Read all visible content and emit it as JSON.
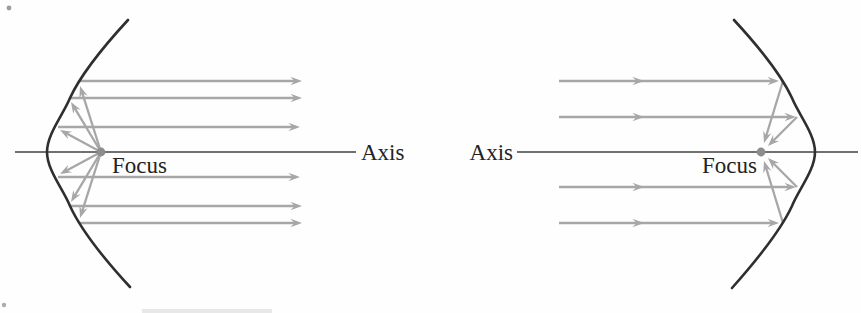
{
  "figure": {
    "description_labels_only": "",
    "colors": {
      "ray": "#a7a7a7",
      "curve": "#2f2f2f",
      "axis": "#404040",
      "dot": "#8d8d8d",
      "text": "#232323",
      "background": "#fefefe",
      "artifact": "#4a4a4a"
    }
  },
  "diagrams": [
    {
      "id": "emitting-parabolic-mirror",
      "axis_label": "Axis",
      "focus_label": "Focus",
      "elements": [
        {
          "name": "axis-line",
          "type": "line",
          "x1": 15,
          "y1": 152,
          "x2": 356,
          "y2": 152,
          "stroke": "axis",
          "width": 1.4
        },
        {
          "name": "reflected-parallel-ray",
          "type": "arrow",
          "x1": 79,
          "y1": 81,
          "x2": 302,
          "y2": 81,
          "stroke": "ray",
          "width": 2.3
        },
        {
          "name": "reflected-parallel-ray",
          "type": "arrow",
          "x1": 70,
          "y1": 98,
          "x2": 302,
          "y2": 98,
          "stroke": "ray",
          "width": 2.3
        },
        {
          "name": "reflected-parallel-ray",
          "type": "arrow",
          "x1": 58,
          "y1": 127,
          "x2": 300,
          "y2": 127,
          "stroke": "ray",
          "width": 2.3
        },
        {
          "name": "reflected-parallel-ray",
          "type": "arrow",
          "x1": 58,
          "y1": 177,
          "x2": 300,
          "y2": 177,
          "stroke": "ray",
          "width": 2.3
        },
        {
          "name": "reflected-parallel-ray",
          "type": "arrow",
          "x1": 70,
          "y1": 206,
          "x2": 302,
          "y2": 206,
          "stroke": "ray",
          "width": 2.3
        },
        {
          "name": "reflected-parallel-ray",
          "type": "arrow",
          "x1": 79,
          "y1": 223,
          "x2": 302,
          "y2": 223,
          "stroke": "ray",
          "width": 2.3
        },
        {
          "name": "focus-emitted-ray",
          "type": "arrow",
          "x1": 101,
          "y1": 152,
          "x2": 80,
          "y2": 86,
          "stroke": "ray",
          "width": 2.3
        },
        {
          "name": "focus-emitted-ray",
          "type": "arrow",
          "x1": 101,
          "y1": 152,
          "x2": 71,
          "y2": 102,
          "stroke": "ray",
          "width": 2.3
        },
        {
          "name": "focus-emitted-ray",
          "type": "arrow",
          "x1": 101,
          "y1": 152,
          "x2": 60,
          "y2": 130,
          "stroke": "ray",
          "width": 2.3
        },
        {
          "name": "focus-emitted-ray",
          "type": "arrow",
          "x1": 101,
          "y1": 152,
          "x2": 60,
          "y2": 174,
          "stroke": "ray",
          "width": 2.3
        },
        {
          "name": "focus-emitted-ray",
          "type": "arrow",
          "x1": 101,
          "y1": 152,
          "x2": 71,
          "y2": 202,
          "stroke": "ray",
          "width": 2.3
        },
        {
          "name": "focus-emitted-ray",
          "type": "arrow",
          "x1": 101,
          "y1": 152,
          "x2": 80,
          "y2": 218,
          "stroke": "ray",
          "width": 2.3
        },
        {
          "name": "parabola-curve",
          "type": "path",
          "d": "M 128,20 C 104,46 82,72 70,98 C 63,115 47,134 47,152 C 47,170 63,189 70,206 C 82,232 106,261 130,287",
          "stroke": "curve",
          "width": 2.6
        },
        {
          "name": "focus-point",
          "type": "dot",
          "x": 101,
          "y": 152,
          "r": 4.4,
          "fill": "dot"
        }
      ]
    },
    {
      "id": "collecting-parabolic-mirror",
      "axis_label": "Axis",
      "focus_label": "Focus",
      "elements": [
        {
          "name": "axis-line",
          "type": "line",
          "x1": 517,
          "y1": 152,
          "x2": 858,
          "y2": 152,
          "stroke": "axis",
          "width": 1.4
        },
        {
          "name": "incoming-parallel-ray",
          "type": "arrow",
          "x1": 559,
          "y1": 81,
          "x2": 779,
          "y2": 81,
          "stroke": "ray",
          "width": 2.3,
          "mid_x": 644
        },
        {
          "name": "incoming-parallel-ray",
          "type": "arrow",
          "x1": 559,
          "y1": 117,
          "x2": 796,
          "y2": 117,
          "stroke": "ray",
          "width": 2.3,
          "mid_x": 644
        },
        {
          "name": "incoming-parallel-ray",
          "type": "arrow",
          "x1": 559,
          "y1": 187,
          "x2": 796,
          "y2": 187,
          "stroke": "ray",
          "width": 2.3,
          "mid_x": 644
        },
        {
          "name": "incoming-parallel-ray",
          "type": "arrow",
          "x1": 559,
          "y1": 223,
          "x2": 779,
          "y2": 223,
          "stroke": "ray",
          "width": 2.3,
          "mid_x": 644
        },
        {
          "name": "converging-ray-to-focus",
          "type": "arrow",
          "x1": 783,
          "y1": 81,
          "x2": 764,
          "y2": 143,
          "stroke": "ray",
          "width": 2.3
        },
        {
          "name": "converging-ray-to-focus",
          "type": "arrow",
          "x1": 797,
          "y1": 117,
          "x2": 768,
          "y2": 146,
          "stroke": "ray",
          "width": 2.3
        },
        {
          "name": "converging-ray-to-focus",
          "type": "arrow",
          "x1": 797,
          "y1": 187,
          "x2": 768,
          "y2": 158,
          "stroke": "ray",
          "width": 2.3
        },
        {
          "name": "converging-ray-to-focus",
          "type": "arrow",
          "x1": 783,
          "y1": 223,
          "x2": 764,
          "y2": 161,
          "stroke": "ray",
          "width": 2.3
        },
        {
          "name": "parabola-curve",
          "type": "path",
          "d": "M 734,20 C 758,46 780,72 792,98 C 799,115 815,134 815,152 C 815,170 799,189 792,206 C 780,232 756,261 732,288",
          "stroke": "curve",
          "width": 2.6
        },
        {
          "name": "focus-point",
          "type": "dot",
          "x": 761,
          "y": 152,
          "r": 4.4,
          "fill": "dot"
        }
      ]
    }
  ],
  "artifacts": [
    {
      "name": "scan-speck",
      "type": "dot",
      "x": 9,
      "y": 8,
      "r": 2.4,
      "fill": "artifact",
      "opacity": 0.55
    },
    {
      "name": "scan-speck",
      "type": "dot",
      "x": 4,
      "y": 305,
      "r": 2.2,
      "fill": "artifact",
      "opacity": 0.45
    },
    {
      "name": "cropped-caption-smudge",
      "type": "rect",
      "x": 142,
      "y": 309,
      "w": 130,
      "h": 4,
      "fill": "artifact",
      "opacity": 0.12
    }
  ]
}
